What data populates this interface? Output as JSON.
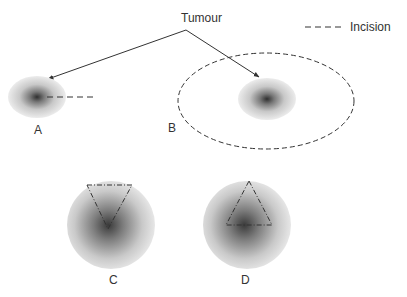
{
  "title_label": "Tumour",
  "legend": {
    "line_style": "dashed",
    "label": "Incision"
  },
  "panels": [
    {
      "id": "A",
      "label": "A",
      "description": "small tumour with linear incision"
    },
    {
      "id": "B",
      "label": "B",
      "description": "tumour with elliptical incision around it"
    },
    {
      "id": "C",
      "label": "C",
      "description": "tumour with inverted wedge incision"
    },
    {
      "id": "D",
      "label": "D",
      "description": "tumour with triangular incision"
    }
  ],
  "colors": {
    "line": "#333333",
    "tumour_core": "#3a3a3a",
    "tumour_edge": "#e8e8e8",
    "background": "#ffffff"
  }
}
